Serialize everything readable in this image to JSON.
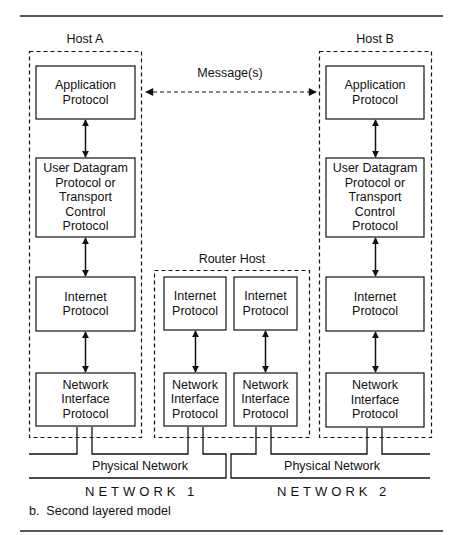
{
  "figure": {
    "caption": "b.  Second layered model",
    "message_label": "Message(s)",
    "host_a": {
      "title": "Host A",
      "layers": [
        {
          "label": "Application Protocol",
          "lines": [
            "Application",
            "Protocol"
          ]
        },
        {
          "label": "User Datagram Protocol or Transport Control Protocol",
          "lines": [
            "User Datagram",
            "Protocol or",
            "Transport",
            "Control",
            "Protocol"
          ]
        },
        {
          "label": "Internet Protocol",
          "lines": [
            "Internet",
            "Protocol"
          ]
        },
        {
          "label": "Network Interface Protocol",
          "lines": [
            "Network",
            "Interface",
            "Protocol"
          ]
        }
      ]
    },
    "host_b": {
      "title": "Host B",
      "layers": [
        {
          "label": "Application Protocol",
          "lines": [
            "Application",
            "Protocol"
          ]
        },
        {
          "label": "User Datagram Protocol or Transport Control Protocol",
          "lines": [
            "User Datagram",
            "Protocol or",
            "Transport",
            "Control",
            "Protocol"
          ]
        },
        {
          "label": "Internet Protocol",
          "lines": [
            "Internet",
            "Protocol"
          ]
        },
        {
          "label": "Network Interface Protocol",
          "lines": [
            "Network",
            "Interface",
            "Protocol"
          ]
        }
      ]
    },
    "router_host": {
      "title": "Router Host",
      "stacks": [
        {
          "ip": [
            "Internet",
            "Protocol"
          ],
          "nip": [
            "Network",
            "Interface",
            "Protocol"
          ]
        },
        {
          "ip": [
            "Internet",
            "Protocol"
          ],
          "nip": [
            "Network",
            "Interface",
            "Protocol"
          ]
        }
      ]
    },
    "networks": [
      {
        "physical_label": "Physical Network",
        "name": "NETWORK 1"
      },
      {
        "physical_label": "Physical Network",
        "name": "NETWORK 2"
      }
    ]
  }
}
